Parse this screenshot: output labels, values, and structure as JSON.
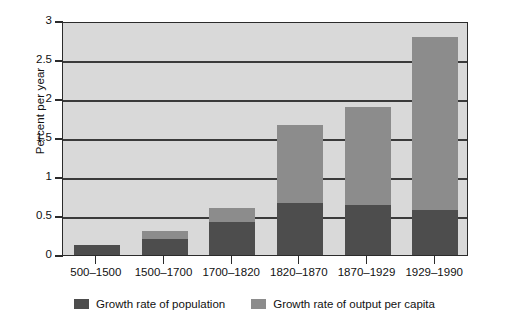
{
  "chart_data": {
    "type": "bar",
    "stacked": true,
    "title": "",
    "xlabel": "",
    "ylabel": "Percent per year",
    "ylim": [
      0,
      3
    ],
    "yticks": [
      "0",
      "0.5",
      "1",
      "1.5",
      "2",
      "2.5",
      "3"
    ],
    "ytick_values": [
      0,
      0.5,
      1,
      1.5,
      2,
      2.5,
      3
    ],
    "grid": "horizontal",
    "legend_position": "bottom",
    "categories": [
      "500–1500",
      "1500–1700",
      "1700–1820",
      "1820–1870",
      "1870–1929",
      "1929–1990"
    ],
    "series": [
      {
        "name": "Growth rate of population",
        "color": "#4d4d4d",
        "values": [
          0.13,
          0.2,
          0.42,
          0.67,
          0.64,
          0.58
        ]
      },
      {
        "name": "Growth rate of output per capita",
        "color": "#8c8c8c",
        "values": [
          0.0,
          0.11,
          0.18,
          1.0,
          1.26,
          2.22
        ]
      }
    ],
    "totals": [
      0.13,
      0.31,
      0.6,
      1.67,
      1.9,
      2.8
    ],
    "plot_background": "#d9d9d9"
  },
  "legend": {
    "entries": [
      {
        "label": "Growth rate of population",
        "color": "#4d4d4d"
      },
      {
        "label": "Growth rate of output per capita",
        "color": "#8c8c8c"
      }
    ]
  }
}
